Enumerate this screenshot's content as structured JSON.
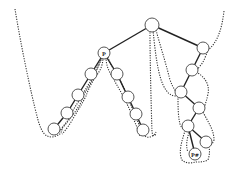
{
  "diagram": {
    "type": "tree-with-traversal-contour",
    "labels": {
      "p_node": "P",
      "p_hash_node": "P#"
    },
    "nodes": [
      {
        "id": "root",
        "label": ""
      },
      {
        "id": "p",
        "label": "P"
      },
      {
        "id": "l1",
        "label": ""
      },
      {
        "id": "l2",
        "label": ""
      },
      {
        "id": "l3",
        "label": ""
      },
      {
        "id": "l4",
        "label": ""
      },
      {
        "id": "r1",
        "label": ""
      },
      {
        "id": "r2",
        "label": ""
      },
      {
        "id": "r3",
        "label": ""
      },
      {
        "id": "r4",
        "label": ""
      },
      {
        "id": "b1",
        "label": ""
      },
      {
        "id": "b2",
        "label": ""
      },
      {
        "id": "b3",
        "label": ""
      },
      {
        "id": "b4",
        "label": ""
      },
      {
        "id": "b5",
        "label": ""
      },
      {
        "id": "b6",
        "label": ""
      },
      {
        "id": "phash",
        "label": "P#"
      }
    ],
    "edges": [
      [
        "root",
        "p"
      ],
      [
        "root",
        "b1"
      ],
      [
        "p",
        "l1"
      ],
      [
        "l1",
        "l2"
      ],
      [
        "l2",
        "l3"
      ],
      [
        "l3",
        "l4"
      ],
      [
        "p",
        "r1"
      ],
      [
        "r1",
        "r2"
      ],
      [
        "r2",
        "r3"
      ],
      [
        "r3",
        "r4"
      ],
      [
        "b1",
        "b2"
      ],
      [
        "b2",
        "b3"
      ],
      [
        "b3",
        "b4"
      ],
      [
        "b4",
        "b5"
      ],
      [
        "b5",
        "b6"
      ],
      [
        "b5",
        "phash"
      ]
    ]
  }
}
